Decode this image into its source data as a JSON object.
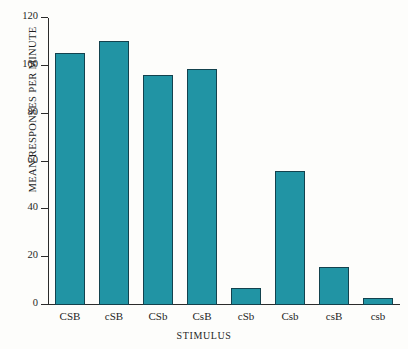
{
  "chart_data": {
    "type": "bar",
    "title": "",
    "xlabel": "STIMULUS",
    "ylabel": "MEAN RESPONSES PER MINUTE",
    "categories": [
      "CSB",
      "cSB",
      "CSb",
      "CsB",
      "cSb",
      "Csb",
      "csB",
      "csb"
    ],
    "values": [
      105.5,
      110.5,
      96,
      98.5,
      7,
      56,
      16,
      3
    ],
    "ylim": [
      0,
      120
    ],
    "yticks": [
      0,
      20,
      40,
      60,
      80,
      100,
      120
    ],
    "ytick_labels": [
      "0",
      "20",
      "40",
      "60",
      "80",
      "100",
      "120"
    ],
    "grid": false,
    "legend": null,
    "bar_color": "#2194a4",
    "bar_edge_color": "#13424e",
    "axis_color": "#2b2b2b",
    "background": "#fdfdfb"
  }
}
